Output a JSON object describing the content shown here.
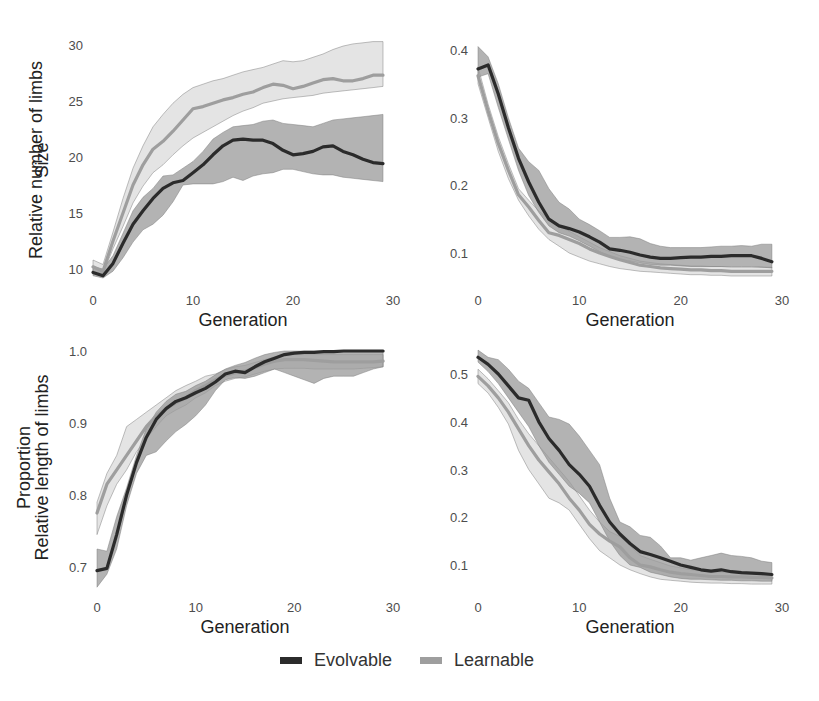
{
  "colors": {
    "evolvable_line": "#2b2b2b",
    "evolvable_band": "#9a9a9a",
    "learnable_line": "#9e9e9e",
    "learnable_band": "#d6d6d6",
    "band_edge": "#7a7a7a"
  },
  "legend": {
    "items": [
      {
        "label": "Evolvable",
        "series": "evolvable"
      },
      {
        "label": "Learnable",
        "series": "learnable"
      }
    ],
    "placement": "bottom-center"
  },
  "chart_data": [
    {
      "type": "line",
      "title": "",
      "xlabel": "Generation",
      "ylabel": "Size",
      "xlim": [
        0,
        30
      ],
      "ylim": [
        9,
        30.5
      ],
      "xticks": [
        0,
        10,
        20,
        30
      ],
      "yticks": [
        10,
        15,
        20,
        25,
        30
      ],
      "ytick_labels": [
        "10",
        "15",
        "20",
        "25",
        "30"
      ],
      "grid": false,
      "x": [
        0,
        1,
        2,
        3,
        4,
        5,
        6,
        7,
        8,
        9,
        10,
        11,
        12,
        13,
        14,
        15,
        16,
        17,
        18,
        19,
        20,
        21,
        22,
        23,
        24,
        25,
        26,
        27,
        28,
        29
      ],
      "series": [
        {
          "name": "Evolvable",
          "mean": [
            9.7,
            9.4,
            10.5,
            12.3,
            14.0,
            15.2,
            16.3,
            17.2,
            17.7,
            17.9,
            18.6,
            19.3,
            20.2,
            21.0,
            21.5,
            21.6,
            21.5,
            21.5,
            21.2,
            20.6,
            20.2,
            20.3,
            20.5,
            20.9,
            21.0,
            20.5,
            20.2,
            19.8,
            19.5,
            19.4
          ],
          "lower": [
            9.4,
            9.2,
            9.8,
            11.0,
            12.4,
            13.5,
            14.0,
            14.8,
            16.0,
            17.5,
            17.6,
            17.6,
            17.6,
            17.8,
            18.2,
            17.9,
            18.3,
            18.5,
            18.6,
            18.9,
            18.9,
            18.7,
            18.5,
            18.4,
            18.4,
            18.2,
            18.1,
            18.0,
            17.9,
            17.8
          ],
          "upper": [
            10.2,
            10.0,
            11.2,
            13.2,
            15.2,
            16.4,
            17.2,
            18.3,
            18.4,
            19.0,
            19.6,
            20.5,
            21.6,
            22.2,
            22.7,
            22.8,
            22.9,
            23.2,
            23.3,
            23.0,
            22.9,
            22.8,
            22.7,
            23.0,
            23.3,
            23.4,
            23.5,
            23.6,
            23.7,
            23.8
          ]
        },
        {
          "name": "Learnable",
          "mean": [
            10.2,
            9.8,
            12.5,
            15.0,
            17.5,
            19.3,
            20.7,
            21.4,
            22.3,
            23.3,
            24.3,
            24.5,
            24.8,
            25.1,
            25.3,
            25.6,
            25.8,
            26.2,
            26.5,
            26.4,
            26.1,
            26.3,
            26.6,
            26.9,
            27.0,
            26.8,
            26.8,
            27.0,
            27.3,
            27.3
          ],
          "lower": [
            9.8,
            9.6,
            11.8,
            13.8,
            15.9,
            17.4,
            18.6,
            19.3,
            20.2,
            21.0,
            21.7,
            22.2,
            22.7,
            23.2,
            23.7,
            24.1,
            24.4,
            24.8,
            25.0,
            25.2,
            25.3,
            25.4,
            25.5,
            25.7,
            25.8,
            25.9,
            26.0,
            26.1,
            26.2,
            26.3
          ],
          "upper": [
            10.8,
            10.4,
            13.3,
            16.3,
            19.0,
            21.0,
            22.7,
            23.8,
            24.8,
            25.6,
            26.2,
            26.5,
            26.8,
            27.0,
            27.3,
            27.6,
            27.8,
            28.0,
            28.3,
            28.6,
            28.5,
            28.6,
            28.9,
            29.2,
            29.6,
            29.9,
            30.1,
            30.2,
            30.3,
            30.3
          ]
        }
      ]
    },
    {
      "type": "line",
      "title": "",
      "xlabel": "Generation",
      "ylabel": "Relative number of limbs",
      "xlim": [
        0,
        30
      ],
      "ylim": [
        0.06,
        0.415
      ],
      "xticks": [
        0,
        10,
        20,
        30
      ],
      "yticks": [
        0.1,
        0.2,
        0.3,
        0.4
      ],
      "ytick_labels": [
        "0.1",
        "0.2",
        "0.3",
        "0.4"
      ],
      "grid": false,
      "x": [
        0,
        1,
        2,
        3,
        4,
        5,
        6,
        7,
        8,
        9,
        10,
        11,
        12,
        13,
        14,
        15,
        16,
        17,
        18,
        19,
        20,
        21,
        22,
        23,
        24,
        25,
        26,
        27,
        28,
        29
      ],
      "series": [
        {
          "name": "Evolvable",
          "mean": [
            0.372,
            0.378,
            0.335,
            0.285,
            0.24,
            0.205,
            0.175,
            0.15,
            0.14,
            0.136,
            0.131,
            0.124,
            0.116,
            0.106,
            0.104,
            0.101,
            0.097,
            0.094,
            0.092,
            0.092,
            0.093,
            0.094,
            0.094,
            0.095,
            0.095,
            0.096,
            0.096,
            0.096,
            0.092,
            0.087
          ],
          "lower": [
            0.36,
            0.365,
            0.315,
            0.268,
            0.222,
            0.185,
            0.16,
            0.14,
            0.13,
            0.125,
            0.118,
            0.11,
            0.102,
            0.094,
            0.09,
            0.088,
            0.085,
            0.083,
            0.082,
            0.082,
            0.081,
            0.08,
            0.08,
            0.08,
            0.08,
            0.08,
            0.08,
            0.08,
            0.079,
            0.078
          ],
          "upper": [
            0.405,
            0.39,
            0.35,
            0.3,
            0.255,
            0.235,
            0.222,
            0.195,
            0.175,
            0.165,
            0.15,
            0.142,
            0.133,
            0.123,
            0.123,
            0.124,
            0.121,
            0.114,
            0.11,
            0.108,
            0.108,
            0.108,
            0.108,
            0.109,
            0.11,
            0.11,
            0.111,
            0.11,
            0.113,
            0.113
          ]
        },
        {
          "name": "Learnable",
          "mean": [
            0.362,
            0.31,
            0.262,
            0.222,
            0.186,
            0.168,
            0.148,
            0.13,
            0.126,
            0.12,
            0.114,
            0.106,
            0.1,
            0.095,
            0.09,
            0.086,
            0.082,
            0.08,
            0.078,
            0.077,
            0.076,
            0.075,
            0.075,
            0.074,
            0.074,
            0.073,
            0.073,
            0.073,
            0.073,
            0.073
          ],
          "lower": [
            0.35,
            0.3,
            0.25,
            0.21,
            0.178,
            0.155,
            0.135,
            0.12,
            0.11,
            0.1,
            0.094,
            0.088,
            0.084,
            0.08,
            0.077,
            0.075,
            0.073,
            0.072,
            0.071,
            0.07,
            0.069,
            0.068,
            0.068,
            0.067,
            0.067,
            0.066,
            0.066,
            0.066,
            0.066,
            0.066
          ],
          "upper": [
            0.375,
            0.32,
            0.272,
            0.232,
            0.195,
            0.178,
            0.162,
            0.15,
            0.14,
            0.132,
            0.124,
            0.116,
            0.108,
            0.102,
            0.096,
            0.092,
            0.088,
            0.086,
            0.084,
            0.083,
            0.082,
            0.081,
            0.081,
            0.08,
            0.08,
            0.079,
            0.079,
            0.079,
            0.079,
            0.079
          ]
        }
      ]
    },
    {
      "type": "line",
      "title": "",
      "xlabel": "Generation",
      "ylabel": "Relative length of limbs",
      "xlim": [
        0,
        30
      ],
      "ylim": [
        0.665,
        1.01
      ],
      "xticks": [
        0,
        10,
        20,
        30
      ],
      "yticks": [
        0.7,
        0.8,
        0.9,
        1.0
      ],
      "ytick_labels": [
        "0.7",
        "0.8",
        "0.9",
        "1.0"
      ],
      "grid": false,
      "x": [
        0,
        1,
        2,
        3,
        4,
        5,
        6,
        7,
        8,
        9,
        10,
        11,
        12,
        13,
        14,
        15,
        16,
        17,
        18,
        19,
        20,
        21,
        22,
        23,
        24,
        25,
        26,
        27,
        28,
        29
      ],
      "series": [
        {
          "name": "Evolvable",
          "mean": [
            0.695,
            0.698,
            0.745,
            0.8,
            0.845,
            0.88,
            0.905,
            0.92,
            0.93,
            0.935,
            0.942,
            0.948,
            0.957,
            0.968,
            0.972,
            0.97,
            0.978,
            0.985,
            0.99,
            0.995,
            0.997,
            0.998,
            0.998,
            0.999,
            0.999,
            1.0,
            1.0,
            1.0,
            1.0,
            1.0
          ],
          "lower": [
            0.672,
            0.69,
            0.725,
            0.785,
            0.83,
            0.855,
            0.86,
            0.875,
            0.888,
            0.898,
            0.91,
            0.925,
            0.945,
            0.96,
            0.963,
            0.962,
            0.965,
            0.97,
            0.975,
            0.97,
            0.965,
            0.96,
            0.955,
            0.962,
            0.965,
            0.965,
            0.965,
            0.97,
            0.975,
            0.978
          ],
          "upper": [
            0.725,
            0.722,
            0.77,
            0.81,
            0.855,
            0.892,
            0.915,
            0.93,
            0.94,
            0.944,
            0.952,
            0.958,
            0.967,
            0.975,
            0.98,
            0.984,
            0.99,
            0.995,
            0.998,
            1.0,
            1.0,
            1.0,
            1.0,
            1.0,
            1.0,
            1.0,
            1.0,
            1.0,
            1.0,
            1.0
          ]
        },
        {
          "name": "Learnable",
          "mean": [
            0.775,
            0.815,
            0.835,
            0.855,
            0.875,
            0.895,
            0.91,
            0.92,
            0.928,
            0.935,
            0.945,
            0.952,
            0.96,
            0.966,
            0.97,
            0.972,
            0.977,
            0.982,
            0.986,
            0.988,
            0.988,
            0.988,
            0.987,
            0.986,
            0.985,
            0.985,
            0.985,
            0.985,
            0.985,
            0.986
          ],
          "lower": [
            0.745,
            0.785,
            0.815,
            0.835,
            0.86,
            0.878,
            0.895,
            0.91,
            0.918,
            0.925,
            0.935,
            0.942,
            0.952,
            0.958,
            0.962,
            0.964,
            0.968,
            0.972,
            0.975,
            0.976,
            0.976,
            0.976,
            0.975,
            0.975,
            0.975,
            0.975,
            0.975,
            0.976,
            0.977,
            0.978
          ],
          "upper": [
            0.79,
            0.83,
            0.855,
            0.895,
            0.905,
            0.915,
            0.925,
            0.935,
            0.945,
            0.952,
            0.958,
            0.965,
            0.968,
            0.974,
            0.978,
            0.98,
            0.984,
            0.988,
            0.992,
            0.994,
            0.995,
            0.995,
            0.995,
            0.995,
            0.995,
            0.995,
            0.995,
            0.995,
            0.995,
            0.995
          ]
        }
      ]
    },
    {
      "type": "line",
      "title": "",
      "xlabel": "Generation",
      "ylabel": "Proportion",
      "xlim": [
        0,
        30
      ],
      "ylim": [
        0.05,
        0.55
      ],
      "xticks": [
        0,
        10,
        20,
        30
      ],
      "yticks": [
        0.1,
        0.2,
        0.3,
        0.4,
        0.5
      ],
      "ytick_labels": [
        "0.1",
        "0.2",
        "0.3",
        "0.4",
        "0.5"
      ],
      "grid": false,
      "x": [
        0,
        1,
        2,
        3,
        4,
        5,
        6,
        7,
        8,
        9,
        10,
        11,
        12,
        13,
        14,
        15,
        16,
        17,
        18,
        19,
        20,
        21,
        22,
        23,
        24,
        25,
        26,
        27,
        28,
        29
      ],
      "series": [
        {
          "name": "Evolvable",
          "mean": [
            0.535,
            0.52,
            0.5,
            0.475,
            0.45,
            0.445,
            0.4,
            0.365,
            0.34,
            0.31,
            0.29,
            0.265,
            0.225,
            0.19,
            0.165,
            0.145,
            0.128,
            0.122,
            0.115,
            0.108,
            0.1,
            0.095,
            0.09,
            0.087,
            0.09,
            0.086,
            0.084,
            0.083,
            0.082,
            0.08
          ],
          "lower": [
            0.525,
            0.505,
            0.48,
            0.45,
            0.42,
            0.39,
            0.35,
            0.315,
            0.29,
            0.265,
            0.25,
            0.23,
            0.19,
            0.15,
            0.12,
            0.1,
            0.095,
            0.085,
            0.08,
            0.075,
            0.072,
            0.07,
            0.07,
            0.069,
            0.068,
            0.068,
            0.067,
            0.067,
            0.066,
            0.066
          ],
          "upper": [
            0.55,
            0.535,
            0.53,
            0.51,
            0.485,
            0.47,
            0.44,
            0.41,
            0.405,
            0.395,
            0.37,
            0.34,
            0.31,
            0.24,
            0.19,
            0.18,
            0.162,
            0.158,
            0.14,
            0.115,
            0.115,
            0.11,
            0.115,
            0.12,
            0.125,
            0.12,
            0.118,
            0.115,
            0.108,
            0.105
          ]
        },
        {
          "name": "Learnable",
          "mean": [
            0.495,
            0.475,
            0.45,
            0.42,
            0.385,
            0.35,
            0.32,
            0.295,
            0.27,
            0.24,
            0.215,
            0.185,
            0.165,
            0.15,
            0.138,
            0.115,
            0.1,
            0.096,
            0.09,
            0.085,
            0.082,
            0.08,
            0.078,
            0.076,
            0.076,
            0.075,
            0.075,
            0.074,
            0.074,
            0.073
          ],
          "lower": [
            0.48,
            0.46,
            0.43,
            0.395,
            0.34,
            0.3,
            0.27,
            0.24,
            0.23,
            0.215,
            0.185,
            0.155,
            0.13,
            0.115,
            0.1,
            0.09,
            0.082,
            0.075,
            0.07,
            0.068,
            0.066,
            0.064,
            0.063,
            0.062,
            0.062,
            0.061,
            0.061,
            0.06,
            0.06,
            0.06
          ],
          "upper": [
            0.51,
            0.49,
            0.465,
            0.44,
            0.405,
            0.375,
            0.35,
            0.325,
            0.3,
            0.275,
            0.245,
            0.215,
            0.19,
            0.17,
            0.16,
            0.14,
            0.12,
            0.112,
            0.105,
            0.098,
            0.094,
            0.09,
            0.088,
            0.086,
            0.085,
            0.084,
            0.083,
            0.082,
            0.082,
            0.081
          ]
        }
      ]
    }
  ]
}
